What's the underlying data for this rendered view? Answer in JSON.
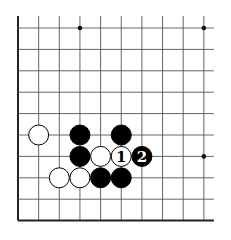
{
  "board": {
    "origin_x": 18,
    "origin_y": 28,
    "spacing_x": 20.65,
    "spacing_y": 21.4,
    "cols": 10,
    "rows": 10,
    "left_edge": true,
    "bottom_edge": true,
    "extend_top": 12,
    "extend_right": 10,
    "line_color": "#555555",
    "edge_color": "#222222",
    "stone_radius": 10
  },
  "star_points": [
    {
      "col": 3,
      "row": 0
    },
    {
      "col": 9,
      "row": 0
    },
    {
      "col": 9,
      "row": 6
    }
  ],
  "stones": [
    {
      "col": 1,
      "row": 5,
      "color": "white",
      "label": ""
    },
    {
      "col": 3,
      "row": 5,
      "color": "black",
      "label": ""
    },
    {
      "col": 5,
      "row": 5,
      "color": "black",
      "label": ""
    },
    {
      "col": 3,
      "row": 6,
      "color": "black",
      "label": ""
    },
    {
      "col": 4,
      "row": 6,
      "color": "white",
      "label": ""
    },
    {
      "col": 5,
      "row": 6,
      "color": "white",
      "label": "1"
    },
    {
      "col": 6,
      "row": 6,
      "color": "black",
      "label": "2"
    },
    {
      "col": 2,
      "row": 7,
      "color": "white",
      "label": ""
    },
    {
      "col": 3,
      "row": 7,
      "color": "white",
      "label": ""
    },
    {
      "col": 4,
      "row": 7,
      "color": "black",
      "label": ""
    },
    {
      "col": 5,
      "row": 7,
      "color": "black",
      "label": ""
    }
  ]
}
